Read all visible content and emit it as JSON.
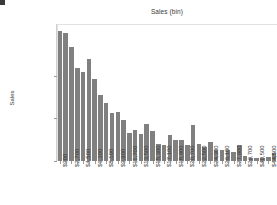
{
  "corner_mark": {
    "name": "corner-mark"
  },
  "chart_data": {
    "type": "bar",
    "title": "Sales (bin)",
    "xlabel": "",
    "ylabel": "Sales",
    "grid": false,
    "legend": "none",
    "ylim": [
      0,
      1610000
    ],
    "ytick_values": [
      0,
      500000,
      1000000
    ],
    "ytick_labels": [
      "$0",
      "$500,000",
      "$1,000,000"
    ],
    "categories": [
      "$900",
      "$1,800",
      "$2,700",
      "$3,600",
      "$4,500",
      "$5,400",
      "$6,300",
      "$7,200",
      "$8,100",
      "$9,000",
      "$9,900",
      "$10,800",
      "$11,700",
      "$12,600",
      "$13,500",
      "$14,400",
      "$15,300",
      "$16,200",
      "$17,100",
      "$18,000",
      "$18,900",
      "$19,800",
      "$20,700",
      "$21,600",
      "$22,500",
      "$23,400",
      "$24,300",
      "$25,200",
      "$26,100",
      "$27,000",
      "$27,900",
      "$28,800",
      "$29,700",
      "$30,600",
      "$40,500",
      "$41,400",
      "$44,500",
      "$98,700"
    ],
    "xtick_labels_shown": [
      "$900",
      "$2,700",
      "$4,500",
      "$6,300",
      "$8,100",
      "$9,900",
      "$11,700",
      "$13,500",
      "$15,300",
      "$17,100",
      "$18,900",
      "$20,700",
      "$22,500",
      "$24,300",
      "$26,100",
      "$27,900",
      "$29,700",
      "$40,500",
      "$98,700"
    ],
    "values": [
      1530000,
      1510000,
      1340000,
      1090000,
      1050000,
      1200000,
      960000,
      780000,
      680000,
      560000,
      580000,
      480000,
      330000,
      360000,
      320000,
      430000,
      350000,
      200000,
      190000,
      310000,
      250000,
      250000,
      190000,
      420000,
      200000,
      160000,
      220000,
      135000,
      130000,
      125000,
      110000,
      190000,
      60000,
      35000,
      30000,
      35000,
      45000,
      95000
    ],
    "bar_color": "#808080"
  }
}
